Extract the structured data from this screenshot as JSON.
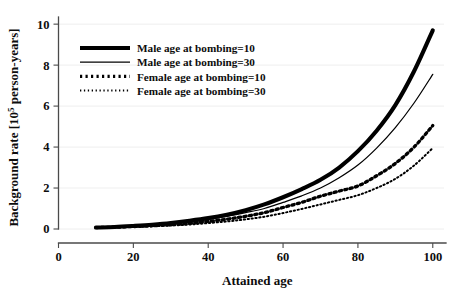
{
  "chart_data": {
    "type": "line",
    "title": "",
    "xlabel": "Attained age",
    "ylabel": "Background rate [10",
    "ylabel_sup": "5",
    "ylabel_tail": " person-years]",
    "xlim": [
      0,
      103
    ],
    "ylim": [
      0,
      10.3
    ],
    "xticks": [
      0,
      20,
      40,
      60,
      80,
      100
    ],
    "yticks": [
      0,
      2,
      4,
      6,
      8,
      10
    ],
    "xtick_labels": [
      "0",
      "20",
      "40",
      "60",
      "80",
      "100"
    ],
    "ytick_labels": [
      "0",
      "2",
      "4",
      "6",
      "8",
      "10"
    ],
    "grid": "horizontal-faint",
    "legend_position": "upper-left-inside",
    "x": [
      10,
      15,
      20,
      25,
      30,
      35,
      40,
      45,
      50,
      55,
      60,
      65,
      70,
      75,
      80,
      85,
      90,
      95,
      100
    ],
    "series": [
      {
        "name": "Male age at bombing=10",
        "style": "thick-solid",
        "stroke_width": 4.1,
        "dash": "none",
        "color": "#000000",
        "values": [
          0.07,
          0.1,
          0.15,
          0.21,
          0.29,
          0.4,
          0.53,
          0.7,
          0.92,
          1.2,
          1.55,
          1.95,
          2.4,
          3.0,
          3.8,
          4.8,
          6.05,
          7.7,
          9.7
        ]
      },
      {
        "name": "Male age at bombing=30",
        "style": "thin-solid",
        "stroke_width": 1.25,
        "dash": "none",
        "color": "#000000",
        "values": [
          0.07,
          0.1,
          0.14,
          0.2,
          0.27,
          0.36,
          0.48,
          0.62,
          0.8,
          1.0,
          1.3,
          1.62,
          2.0,
          2.5,
          3.12,
          3.95,
          4.95,
          6.15,
          7.55
        ]
      },
      {
        "name": "Female age at bombing=10",
        "style": "bold-dotted",
        "stroke_width": 3.3,
        "dash": "2.2 3.3",
        "color": "#000000",
        "values": [
          0.07,
          0.09,
          0.12,
          0.16,
          0.21,
          0.28,
          0.37,
          0.48,
          0.62,
          0.8,
          1.05,
          1.3,
          1.6,
          1.85,
          2.1,
          2.6,
          3.2,
          4.0,
          5.05
        ]
      },
      {
        "name": "Female age at bombing=30",
        "style": "fine-dotted",
        "stroke_width": 2.0,
        "dash": "1.3 2.6",
        "color": "#000000",
        "values": [
          0.06,
          0.08,
          0.1,
          0.13,
          0.17,
          0.22,
          0.29,
          0.37,
          0.47,
          0.6,
          0.78,
          0.98,
          1.2,
          1.42,
          1.65,
          2.0,
          2.45,
          3.1,
          3.95
        ]
      }
    ]
  },
  "legend": {
    "entries": [
      {
        "label": "Male age at bombing=10"
      },
      {
        "label": "Male age at bombing=30"
      },
      {
        "label": "Female age at bombing=10"
      },
      {
        "label": "Female age at bombing=30"
      }
    ]
  }
}
